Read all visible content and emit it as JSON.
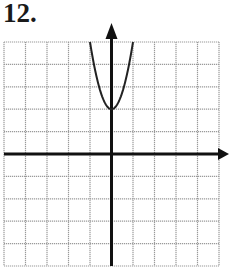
{
  "problem": {
    "number_label": "12."
  },
  "chart_data": {
    "type": "line",
    "title": "",
    "xlabel": "",
    "ylabel": "",
    "function": "y = 3x^2 + 2",
    "vertex": [
      0,
      2
    ],
    "opens": "up",
    "xlim": [
      -5,
      5
    ],
    "ylim": [
      -5,
      5
    ],
    "grid": true,
    "grid_step": 1,
    "tick_labels": false,
    "series": [
      {
        "name": "parabola",
        "x": [
          -1,
          -0.5,
          0,
          0.5,
          1
        ],
        "y": [
          5,
          2.75,
          2,
          2.75,
          5
        ]
      }
    ],
    "axes": {
      "x_arrow": "right",
      "y_arrow": "up"
    }
  },
  "colors": {
    "grid": "#9a9a9a",
    "axis": "#111111",
    "curve": "#222222",
    "background": "#ffffff"
  }
}
